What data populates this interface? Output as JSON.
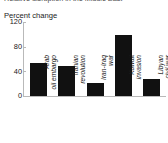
{
  "chart_data": {
    "type": "bar",
    "title": "Relative disruption in the Middle East",
    "subtitle": "",
    "ylabel": "Percent change",
    "xlabel": "",
    "categories": [
      "Arab oil embargo",
      "Iranian revolution",
      "Iran-Iraq war",
      "Kuwait invasion",
      "Libyan civil war"
    ],
    "values": [
      53,
      49,
      21,
      99,
      28
    ],
    "ytick_labels": [
      "0",
      "40",
      "80",
      "120"
    ],
    "yticks": [
      0,
      40,
      80,
      120
    ],
    "ylim": [
      0,
      120
    ],
    "grid": false,
    "legend": null,
    "bar_color": "#111111",
    "axis_color": "#b9b9b9",
    "background": "#ffffff"
  },
  "axis": {
    "unit_label": "Percent change",
    "top_value": "120"
  }
}
